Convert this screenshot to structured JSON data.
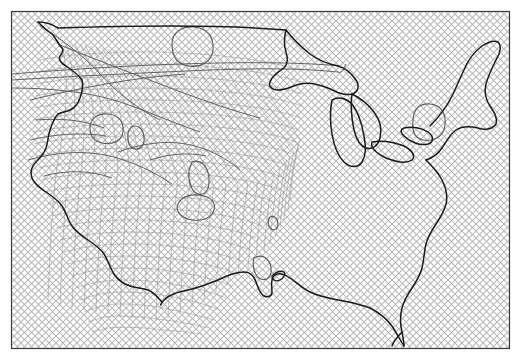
{
  "figure": {
    "kind": "contour-map",
    "title": "",
    "subtitle": "",
    "region_label": "Continental United States",
    "projection_label": "",
    "background_fill_label": "diagonal-crosshatch",
    "frame_visible": true,
    "axis_labels": [],
    "tick_labels": [],
    "legend_entries": [],
    "annotations": []
  },
  "colors": {
    "page_background": "#ffffff",
    "plot_background": "#ffffff",
    "hatch_line": "#b9b9b9",
    "frame_line": "#3a3a3a",
    "coastline": "#1a1a1a",
    "contour_line": "#5a5a5a",
    "mesh_line": "#8f8f8f"
  },
  "chart_data": {
    "type": "contour",
    "title": "",
    "xlabel": "",
    "ylabel": "",
    "xlim": [
      11,
      509
    ],
    "ylim": [
      11,
      348
    ],
    "grid": false,
    "legend_position": "none",
    "hatch": {
      "pattern": "crosshatch-diagonal",
      "spacing_px": 7,
      "angle_deg": 45,
      "line_width_px": 1.1
    },
    "frame": {
      "x": 11,
      "y": 11,
      "width": 498,
      "height": 337,
      "line_width_px": 1.2
    },
    "closed_contours": [
      {
        "name": "lake-of-the-woods-lobe",
        "cx": 190,
        "cy": 47,
        "rx": 22,
        "ry": 19
      },
      {
        "name": "great-basin-lobe",
        "cx": 106,
        "cy": 127,
        "rx": 17,
        "ry": 13
      },
      {
        "name": "colorado-plateau-lobe",
        "cx": 137,
        "cy": 136,
        "rx": 7,
        "ry": 11
      },
      {
        "name": "central-plains-lobe",
        "cx": 200,
        "cy": 177,
        "rx": 9,
        "ry": 16
      },
      {
        "name": "midwest-point-lobe",
        "cx": 273,
        "cy": 222,
        "rx": 4,
        "ry": 6
      },
      {
        "name": "gulf-lobe",
        "cx": 263,
        "cy": 267,
        "rx": 8,
        "ry": 12
      },
      {
        "name": "northeast-lobe",
        "cx": 428,
        "cy": 122,
        "rx": 16,
        "ry": 18
      },
      {
        "name": "south-texas-lobe",
        "cx": 196,
        "cy": 210,
        "rx": 18,
        "ry": 10
      }
    ],
    "mesh": {
      "description": "distorted quadrilateral mesh concentrated over the western half",
      "u_lines": 26,
      "v_lines": 24,
      "extent_x": [
        28,
        300
      ],
      "extent_y": [
        28,
        320
      ]
    }
  }
}
